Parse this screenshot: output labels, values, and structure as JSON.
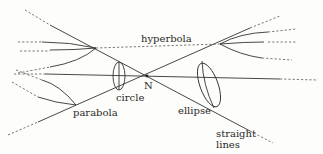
{
  "diagram": {
    "vertex_label": "N",
    "labels": {
      "hyperbola": "hyperbola",
      "circle": "circle",
      "ellipse": "ellipse",
      "parabola": "parabola",
      "straight_lines_1": "straight",
      "straight_lines_2": "lines"
    },
    "colors": {
      "line": "#333333",
      "background": "#fdfdfb"
    }
  }
}
